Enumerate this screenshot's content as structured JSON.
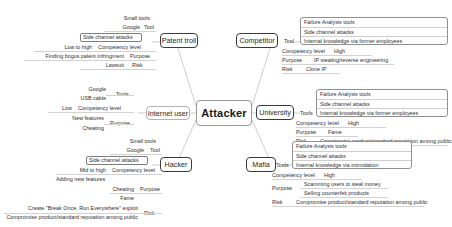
{
  "diagram": {
    "type": "mind-map",
    "title": "Attacker",
    "center": {
      "label": "Attacker"
    },
    "branches": [
      {
        "id": "patent-troll",
        "label": "Patent troll",
        "side": "left",
        "tools_label": "Tool",
        "tools": [
          "Small tools",
          "Google",
          "Side channel attacks"
        ],
        "competency_label": "Competency level",
        "competency": "Low to high",
        "purpose_label": "Purpose",
        "purpose": [
          "Finding bogus patent infringment"
        ],
        "risk_label": "Risk",
        "risk": [
          "Lawsuit"
        ]
      },
      {
        "id": "internet-user",
        "label": "Internet user",
        "side": "left",
        "tools_label": "Tools",
        "tools": [
          "Google",
          "USB cable"
        ],
        "competency_label": "Competency level",
        "competency": "Low",
        "purpose_label": "Purpose",
        "purpose": [
          "New features",
          "Cheating"
        ],
        "risk_label": "",
        "risk": []
      },
      {
        "id": "hacker",
        "label": "Hacker",
        "side": "left",
        "tools_label": "Tool",
        "tools": [
          "Small tools",
          "Google",
          "Side channel attacks"
        ],
        "competency_label": "Competency level",
        "competency": "Mid to high",
        "purpose_label": "Purpose",
        "purpose": [
          "Adding new features",
          "Cheating",
          "Fame"
        ],
        "risk_label": "Risk",
        "risk": [
          "Create \"Break Once, Run Everywhere\" exploit",
          "Compromise product/standard reputation among public"
        ]
      },
      {
        "id": "competitor",
        "label": "Competitor",
        "side": "right",
        "tools_label": "Tool",
        "tools": [
          "Failure Analysis tools",
          "Side channel attacks",
          "Internal knowledge via former employees"
        ],
        "competency_label": "Competency level",
        "competency": "High",
        "purpose_label": "Purpose",
        "purpose": [
          "IP stealing/reverse engineering"
        ],
        "risk_label": "Risk",
        "risk": [
          "Clone IP"
        ]
      },
      {
        "id": "university",
        "label": "University",
        "side": "right",
        "tools_label": "Tools",
        "tools": [
          "Failure Analysis tools",
          "Side channel attacks",
          "Internal knowledge via former employees"
        ],
        "competency_label": "Competency level",
        "competency": "High",
        "purpose_label": "Purpose",
        "purpose": [
          "Fame"
        ],
        "risk_label": "Risk",
        "risk": [
          "Compromise product/standard reputation among public"
        ]
      },
      {
        "id": "mafia",
        "label": "Mafia",
        "side": "right",
        "tools_label": "Tools",
        "tools": [
          "Failure Analysis tools",
          "Side channel attacks",
          "Internal knowledge via intimidation"
        ],
        "competency_label": "Competency level",
        "competency": "High",
        "purpose_label": "Purpose",
        "purpose": [
          "Scamming users to steal money",
          "Selling counterfeit products"
        ],
        "risk_label": "Risk",
        "risk": [
          "Compromise product/standard reputation among public"
        ]
      }
    ]
  }
}
